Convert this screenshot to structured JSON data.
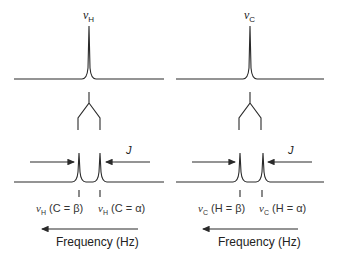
{
  "diagram": {
    "panels": [
      {
        "id": "proton",
        "top_peak_label_symbol": "ν",
        "top_peak_label_sub": "H",
        "split_labels": [
          {
            "symbol": "ν",
            "sub": "H",
            "text": " (C = β)"
          },
          {
            "symbol": "ν",
            "sub": "H",
            "text": " (C = α)"
          }
        ],
        "coupling_label": "J",
        "axis_label": "Frequency (Hz)"
      },
      {
        "id": "carbon",
        "top_peak_label_symbol": "ν",
        "top_peak_label_sub": "C",
        "split_labels": [
          {
            "symbol": "ν",
            "sub": "C",
            "text": " (H = β)"
          },
          {
            "symbol": "ν",
            "sub": "C",
            "text": " (H = α)"
          }
        ],
        "coupling_label": "J",
        "axis_label": "Frequency (Hz)"
      }
    ],
    "colors": {
      "line": "#2a2a2a",
      "text": "#222222"
    }
  }
}
